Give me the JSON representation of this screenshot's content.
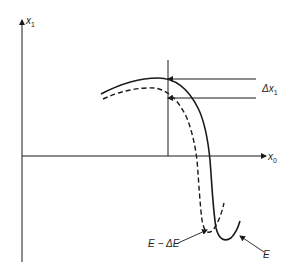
{
  "diagram": {
    "axes": {
      "y_axis_label": "x",
      "y_axis_sub": "1",
      "x_axis_label": "x",
      "x_axis_sub": "0"
    },
    "annotations": {
      "delta_x1_label": "Δx",
      "delta_x1_sub": "1",
      "curve_E_label": "E",
      "curve_E_minus_dE_label": "E − ΔE"
    },
    "curves": [
      {
        "name": "E",
        "style": "solid"
      },
      {
        "name": "E - ΔE",
        "style": "dashed"
      }
    ],
    "colors": {
      "line": "#1a1a1a",
      "background": "#ffffff"
    }
  }
}
